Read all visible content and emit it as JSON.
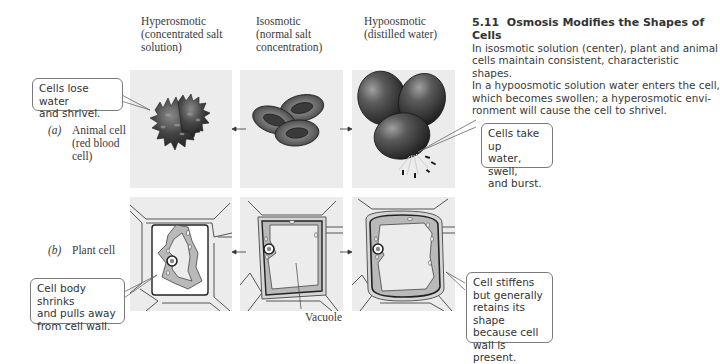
{
  "figure": {
    "number": "5.11",
    "title": "Osmosis Modifies the Shapes of Cells",
    "caption_lines": [
      "In isosmotic solution (center), plant and animal",
      "cells maintain consistent, characteristic shapes.",
      "In a hypoosmotic solution water enters the cell,",
      "which becomes swollen; a hyperosmotic envi-",
      "ronment will cause the cell to shrivel."
    ]
  },
  "columns": [
    {
      "lines": [
        "Hyperosmotic",
        "(concentrated salt",
        "solution)"
      ]
    },
    {
      "lines": [
        "Isosmotic",
        "(normal salt",
        "concentration)"
      ]
    },
    {
      "lines": [
        "Hypoosmotic",
        "(distilled water)"
      ]
    }
  ],
  "rows": [
    {
      "letter": "(a)",
      "lines": [
        "Animal cell",
        "(red blood",
        "cell)"
      ]
    },
    {
      "letter": "(b)",
      "lines": [
        "Plant cell"
      ]
    }
  ],
  "callouts": {
    "shrivel": [
      "Cells lose water",
      "and shrivel."
    ],
    "burst": [
      "Cells take up",
      "water, swell,",
      "and burst."
    ],
    "plasmolysis": [
      "Cell body shrinks",
      "and pulls away",
      "from cell wall."
    ],
    "turgid": [
      "Cell stiffens",
      "but generally",
      "retains its shape",
      "because cell",
      "wall is present."
    ]
  },
  "labels": {
    "vacuole": "Vacuole"
  },
  "colors": {
    "panel_bg": "#ececec",
    "cell_dark": "#3c3c3c",
    "cytoplasm": "#b9b9b9",
    "wall": "#d6d6d6"
  }
}
